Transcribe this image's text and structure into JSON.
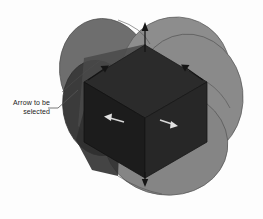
{
  "annotation": {
    "line1": "Arrow to be",
    "line2": "selected",
    "full_text": "Arrow to be selected",
    "leader_line_name": "leader-line"
  },
  "scene": {
    "title": "3D manipulator arrows on blended solid",
    "background_color": "#fdfdfd",
    "colors": {
      "background": "#fdfdfd",
      "disc_back_left": "#6e6e6e",
      "disc_back_right": "#8d8d8d",
      "disc_right": "#8a8a8a",
      "disc_bottom": "#858585",
      "cube_top": "#2b2b2b",
      "cube_left": "#1e1e1e",
      "cube_right": "#262626",
      "outline": "#4a4a4a",
      "arrow_dark": "#151515",
      "arrow_light": "#d8d8d8",
      "annotation_text": "#1a1a1a",
      "leader_line": "#555555"
    },
    "arrows": [
      {
        "name": "arrow-up-top",
        "shade": "dark",
        "direction": "up"
      },
      {
        "name": "arrow-upper-right",
        "shade": "dark",
        "direction": "up-right"
      },
      {
        "name": "arrow-upper-left",
        "shade": "dark",
        "direction": "up-left"
      },
      {
        "name": "arrow-lower-left",
        "shade": "light",
        "direction": "left"
      },
      {
        "name": "arrow-lower-right",
        "shade": "light",
        "direction": "right"
      },
      {
        "name": "arrow-down-bottom",
        "shade": "dark",
        "direction": "down"
      }
    ]
  }
}
